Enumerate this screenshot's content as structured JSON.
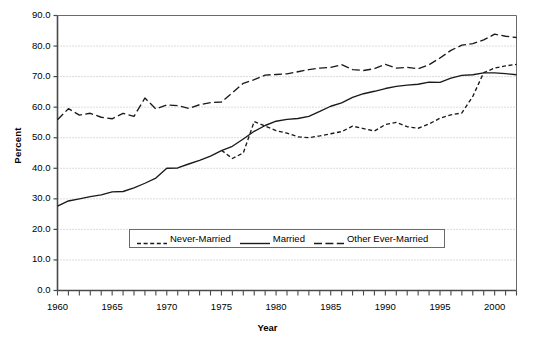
{
  "chart_data": {
    "type": "line",
    "title": "",
    "xlabel": "Year",
    "ylabel": "Percent",
    "xlim": [
      1960,
      2002
    ],
    "ylim": [
      0,
      90
    ],
    "ytick_step": 10,
    "yticks": [
      "0.0",
      "10.0",
      "20.0",
      "30.0",
      "40.0",
      "50.0",
      "60.0",
      "70.0",
      "80.0",
      "90.0"
    ],
    "ytick_values": [
      0,
      10,
      20,
      30,
      40,
      50,
      60,
      70,
      80,
      90
    ],
    "xticks": [
      "1960",
      "1965",
      "1970",
      "1975",
      "1980",
      "1985",
      "1990",
      "1995",
      "2000"
    ],
    "xtick_values": [
      1960,
      1965,
      1970,
      1975,
      1980,
      1985,
      1990,
      1995,
      2000
    ],
    "minor_xtick_interval": 1,
    "grid": "horizontal-dotted",
    "legend_position": "inside-bottom-center",
    "line_color": "#1a1a1a",
    "grid_color": "#b8b8b8",
    "axis_color": "#4a4a4a",
    "series": [
      {
        "name": "Never-Married",
        "style": "short-dash",
        "x": [
          1975,
          1976,
          1977,
          1978,
          1979,
          1980,
          1981,
          1982,
          1983,
          1984,
          1985,
          1986,
          1987,
          1988,
          1989,
          1990,
          1991,
          1992,
          1993,
          1994,
          1995,
          1996,
          1997,
          1998,
          1999,
          2000,
          2001,
          2002
        ],
        "values": [
          45.9,
          43.2,
          45.0,
          55.3,
          53.8,
          52.3,
          51.5,
          50.3,
          50.0,
          50.6,
          51.3,
          52.0,
          53.8,
          53.0,
          52.2,
          54.3,
          55.0,
          53.6,
          53.1,
          54.5,
          56.4,
          57.5,
          58.1,
          63.5,
          71.3,
          72.8,
          73.5,
          74.0
        ]
      },
      {
        "name": "Married",
        "style": "solid",
        "x": [
          1960,
          1961,
          1962,
          1963,
          1964,
          1965,
          1966,
          1967,
          1968,
          1969,
          1970,
          1971,
          1972,
          1973,
          1974,
          1975,
          1976,
          1977,
          1978,
          1979,
          1980,
          1981,
          1982,
          1983,
          1984,
          1985,
          1986,
          1987,
          1988,
          1989,
          1990,
          1991,
          1992,
          1993,
          1994,
          1995,
          1996,
          1997,
          1998,
          1999,
          2000,
          2001,
          2002
        ],
        "values": [
          27.6,
          29.3,
          30.0,
          30.7,
          31.3,
          32.3,
          32.4,
          33.6,
          35.1,
          36.8,
          40.0,
          40.1,
          41.4,
          42.6,
          44.0,
          45.8,
          47.2,
          49.6,
          52.1,
          54.0,
          55.4,
          56.0,
          56.3,
          57.0,
          58.6,
          60.3,
          61.4,
          63.2,
          64.4,
          65.2,
          66.1,
          66.8,
          67.2,
          67.5,
          68.2,
          68.1,
          69.5,
          70.4,
          70.6,
          71.2,
          71.2,
          71.0,
          70.6
        ]
      },
      {
        "name": "Other Ever-Married",
        "style": "long-dash",
        "x": [
          1960,
          1961,
          1962,
          1963,
          1964,
          1965,
          1966,
          1967,
          1968,
          1969,
          1970,
          1971,
          1972,
          1973,
          1974,
          1975,
          1976,
          1977,
          1978,
          1979,
          1980,
          1981,
          1982,
          1983,
          1984,
          1985,
          1986,
          1987,
          1988,
          1989,
          1990,
          1991,
          1992,
          1993,
          1994,
          1995,
          1996,
          1997,
          1998,
          1999,
          2000,
          2001,
          2002
        ],
        "values": [
          55.9,
          59.5,
          57.4,
          58.0,
          56.7,
          56.2,
          58.0,
          57.0,
          63.0,
          59.4,
          60.7,
          60.5,
          59.6,
          60.8,
          61.5,
          61.7,
          64.7,
          67.8,
          69.0,
          70.5,
          70.7,
          70.9,
          71.6,
          72.3,
          72.8,
          73.0,
          73.9,
          72.3,
          72.0,
          72.6,
          74.0,
          72.8,
          73.0,
          72.6,
          73.9,
          76.1,
          78.6,
          80.3,
          80.8,
          82.0,
          83.9,
          83.2,
          82.8
        ]
      }
    ]
  },
  "axis": {
    "y_title": "Percent",
    "x_title": "Year"
  },
  "legend": {
    "items": [
      {
        "label": "Never-Married",
        "style": "short-dash"
      },
      {
        "label": "Married",
        "style": "solid"
      },
      {
        "label": "Other Ever-Married",
        "style": "long-dash"
      }
    ]
  }
}
